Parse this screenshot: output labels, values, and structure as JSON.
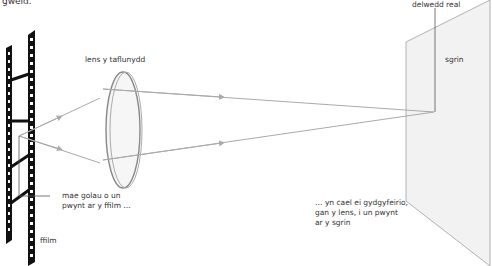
{
  "top_fragment": "gweld.",
  "labels": {
    "lens": "lens y taflunydd",
    "screen": "sgrin",
    "real_image": "delwedd real",
    "film": "ffilm",
    "point_caption": [
      "mae golau o un",
      "pwynt ar y ffilm …"
    ],
    "converge_caption": [
      "… yn cael ei gydgyfeirio,",
      "gan y lens, i un pwynt",
      "ar y sgrin"
    ]
  },
  "colors": {
    "film": "#111111",
    "ray": "#aaaaaa",
    "lens_stroke": "#888888",
    "lens_fill": "#f4f4f4",
    "screen_fill": "#f2f2f2",
    "screen_stroke": "#999999",
    "leader": "#555555"
  }
}
